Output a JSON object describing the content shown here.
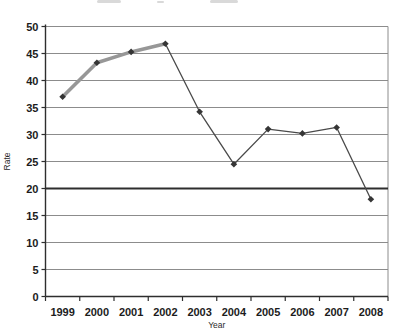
{
  "page": {
    "background_color": "#ffffff",
    "cropped_title_note": "faint bottom edge of a cropped chart title"
  },
  "chart_data": {
    "type": "line",
    "title": "",
    "xlabel": "Year",
    "ylabel": "Rate",
    "categories": [
      "1999",
      "2000",
      "2001",
      "2002",
      "2003",
      "2004",
      "2005",
      "2006",
      "2007",
      "2008"
    ],
    "series": [
      {
        "name": "rate-thin-line",
        "values": [
          37,
          43.3,
          45.3,
          46.8,
          34.2,
          24.5,
          31,
          30.2,
          31.3,
          18
        ],
        "color": "#4a4a4a",
        "width": 1.3,
        "marker": "diamond"
      },
      {
        "name": "rate-thick-overlay-1999-2002",
        "values": [
          37,
          43.3,
          45.3,
          46.8,
          null,
          null,
          null,
          null,
          null,
          null
        ],
        "color": "#979797",
        "width": 3.6,
        "marker": "diamond"
      }
    ],
    "reference_line": {
      "y": 20,
      "color": "#2e2e2e",
      "width": 2.2
    },
    "ylim": [
      0,
      50
    ],
    "yticks": [
      0,
      5,
      10,
      15,
      20,
      25,
      30,
      35,
      40,
      45,
      50
    ],
    "grid": true,
    "legend_position": "none",
    "colors": {
      "gridline": "#8c8c8c",
      "axis": "#2e2e2e",
      "marker": "#353535",
      "tick_text": "#1c1c1c"
    }
  }
}
